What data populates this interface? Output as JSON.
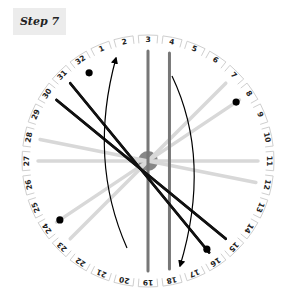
{
  "step": {
    "label": "Step 7"
  },
  "disk": {
    "center": [
      148,
      161
    ],
    "radius": 126,
    "slot_count": 32,
    "slots": [
      "1",
      "2",
      "3",
      "4",
      "5",
      "6",
      "7",
      "8",
      "9",
      "10",
      "11",
      "12",
      "13",
      "14",
      "15",
      "16",
      "17",
      "18",
      "19",
      "20",
      "21",
      "22",
      "23",
      "24",
      "25",
      "26",
      "27",
      "28",
      "29",
      "30",
      "31",
      "32"
    ]
  },
  "threads": [
    {
      "from": "3",
      "to": "19",
      "color": "#777777",
      "style": "dark-gray"
    },
    {
      "from": "4",
      "to": "18",
      "color": "#777777",
      "style": "dark-gray"
    },
    {
      "from": "31",
      "to": "16",
      "color": "#111111",
      "style": "black"
    },
    {
      "from": "30",
      "to": "15",
      "color": "#111111",
      "style": "black"
    },
    {
      "from": "7",
      "to": "23",
      "color": "#d8d8d8",
      "style": "light-gray"
    },
    {
      "from": "8",
      "to": "24",
      "color": "#d8d8d8",
      "style": "light-gray"
    },
    {
      "from": "28",
      "to": "12",
      "color": "#d8d8d8",
      "style": "light-gray"
    },
    {
      "from": "27",
      "to": "11",
      "color": "#d8d8d8",
      "style": "light-gray"
    }
  ],
  "markers": [
    {
      "near_slot": "32"
    },
    {
      "near_slot": "8"
    },
    {
      "near_slot": "24"
    },
    {
      "near_slot": "16"
    }
  ],
  "arrows": [
    {
      "name": "left-arc-up",
      "direction": "up"
    },
    {
      "name": "right-arc-down",
      "direction": "down"
    }
  ],
  "colors": {
    "center_hub": "#7a7a7a",
    "disk_fill": "#ffffff",
    "disk_edge": "#cfcfcf"
  }
}
